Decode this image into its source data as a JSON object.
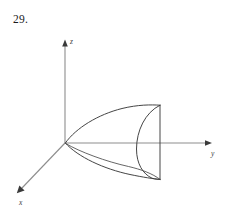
{
  "figure": {
    "problem_number": "29.",
    "background_color": "#ffffff",
    "width": 231,
    "height": 214
  },
  "axes": {
    "origin": {
      "x": 65,
      "y": 143
    },
    "x_axis": {
      "label": "x",
      "label_x": 19,
      "label_y": 205,
      "from_x": 65,
      "from_y": 143,
      "to_x": 18,
      "to_y": 192,
      "color": "#8d8d8d"
    },
    "y_axis": {
      "label": "y",
      "label_x": 211,
      "label_y": 156,
      "from_x": 65,
      "from_y": 143,
      "to_x": 210,
      "to_y": 143,
      "color": "#8d8d8d"
    },
    "z_axis": {
      "label": "z",
      "label_x": 70,
      "label_y": 44,
      "from_x": 65,
      "from_y": 143,
      "to_x": 65,
      "to_y": 42,
      "color": "#8d8d8d"
    }
  },
  "surface": {
    "name": "paraboloid",
    "description": "Paraboloid opening along the positive y-axis, truncated by a flat plane",
    "stroke_color": "#3b3b3b",
    "vertex": {
      "x": 65,
      "y": 143
    },
    "cap_line": {
      "x": 160,
      "top_y": 105,
      "bottom_y": 179
    },
    "upper_silhouette": "M65,143 C78,125 104,112 126,107 C140,104.5 152,105 158.5,105.5",
    "lower_silhouette": "M65,143 C80,158 108,170 132,175 C145,177.5 155,178.8 160,179.2",
    "cap_rim_arc": "M158.5,105.5 C142,118 134.5,140 137,158 C138.6,169 144,174.5 150.5,177.2",
    "inner_parabola": "M65,143 C82,151 110,161 132,167 C143,170 152,173.5 158,176.5",
    "cap_rim_arc_lower_join": "M150.5,177.2 C154,178.2 157.5,179 160,179.2"
  }
}
